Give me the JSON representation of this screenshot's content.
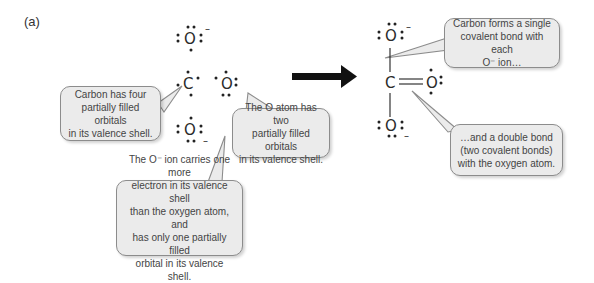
{
  "panel": {
    "label": "(a)"
  },
  "reactants": {
    "atoms": [
      {
        "id": "o-ion-top",
        "symbol": "O",
        "charge": "–"
      },
      {
        "id": "carbon",
        "symbol": "C",
        "charge": ""
      },
      {
        "id": "o-atom",
        "symbol": "O",
        "charge": ""
      },
      {
        "id": "o-ion-bottom",
        "symbol": "O",
        "charge": "–"
      }
    ]
  },
  "product": {
    "atoms": [
      {
        "id": "o-ion-top",
        "symbol": "O",
        "charge": "–"
      },
      {
        "id": "carbon",
        "symbol": "C",
        "charge": ""
      },
      {
        "id": "o-double",
        "symbol": "O",
        "charge": ""
      },
      {
        "id": "o-ion-bottom",
        "symbol": "O",
        "charge": "–"
      }
    ]
  },
  "callouts": {
    "carbon": {
      "lines": [
        "Carbon has four",
        "partially filled orbitals",
        "in its valence shell."
      ]
    },
    "o_atom": {
      "lines": [
        "The O atom has two",
        "partially filled orbitals",
        "in its valence shell."
      ]
    },
    "o_ion": {
      "lines": [
        "The O⁻ ion carries one more",
        "electron in its valence shell",
        "than the oxygen atom, and",
        "has only one partially filled",
        "orbital in its valence shell."
      ]
    },
    "single_bond": {
      "lines": [
        "Carbon forms a single",
        "covalent bond with each",
        "O⁻ ion…"
      ]
    },
    "double_bond": {
      "lines": [
        "…and a double bond",
        "(two covalent bonds)",
        "with the oxygen atom."
      ]
    }
  },
  "colors": {
    "callout_fill": "#ebebeb",
    "callout_border": "#8c8c8c",
    "arrow": "#111111",
    "text": "#444444"
  }
}
